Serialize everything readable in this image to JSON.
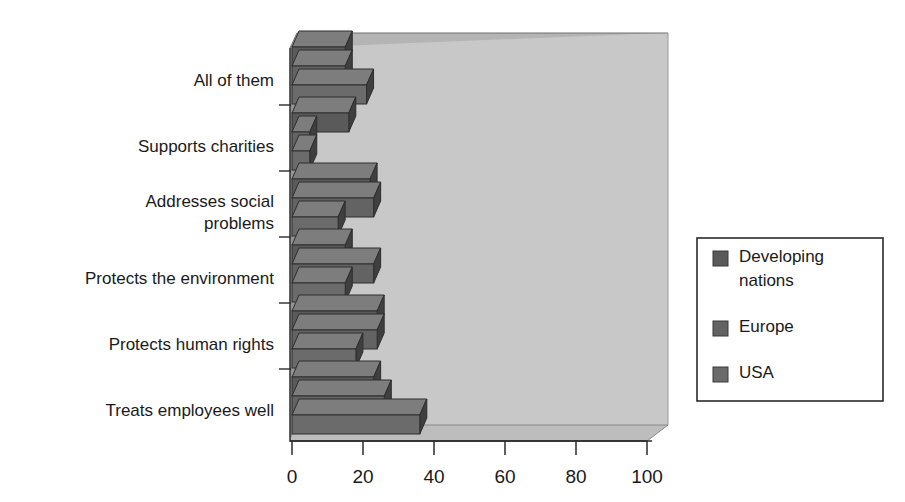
{
  "chart_data": {
    "type": "bar",
    "orientation": "horizontal",
    "style": "3d-grouped-bar",
    "title": "",
    "subtitle": "",
    "xlabel": "",
    "ylabel": "",
    "categories": [
      "All of them",
      "Supports charities",
      "Addresses social problems",
      "Protects the environment",
      "Protects human rights",
      "Treats employees well"
    ],
    "category_label_lines": [
      [
        "All of them"
      ],
      [
        "Supports charities"
      ],
      [
        "Addresses social",
        "problems"
      ],
      [
        "Protects the environment"
      ],
      [
        "Protects human rights"
      ],
      [
        "Treats employees well"
      ]
    ],
    "series": [
      {
        "name": "Developing nations",
        "color": "#5a5a5a",
        "values": [
          15,
          16,
          22,
          15,
          24,
          23
        ]
      },
      {
        "name": "Europe",
        "color": "#636363",
        "values": [
          15,
          5,
          23,
          23,
          24,
          26
        ]
      },
      {
        "name": "USA",
        "color": "#6b6b6b",
        "values": [
          21,
          5,
          13,
          15,
          18,
          36
        ]
      }
    ],
    "xlim": [
      0,
      105
    ],
    "xticks": [
      0,
      20,
      40,
      60,
      80,
      100
    ],
    "xtick_labels": [
      "0",
      "20",
      "40",
      "60",
      "80",
      "100"
    ],
    "grid": false,
    "legend_position": "right",
    "legend_entries": [
      {
        "label_lines": [
          "Developing",
          "nations"
        ],
        "swatch_color": "#5a5a5a"
      },
      {
        "label_lines": [
          "Europe"
        ],
        "swatch_color": "#636363"
      },
      {
        "label_lines": [
          "USA"
        ],
        "swatch_color": "#6b6b6b"
      }
    ]
  },
  "colors": {
    "plot_back_wall": "#c8c8c8",
    "plot_floor": "#bdbdbd",
    "plot_left_wall": "#8f8f8f",
    "axis_line": "#3a3a3a",
    "bar_top": "#7d7d7d",
    "bar_side": "#3f3f3f",
    "legend_border": "#2b2b2b",
    "background": "#ffffff"
  }
}
